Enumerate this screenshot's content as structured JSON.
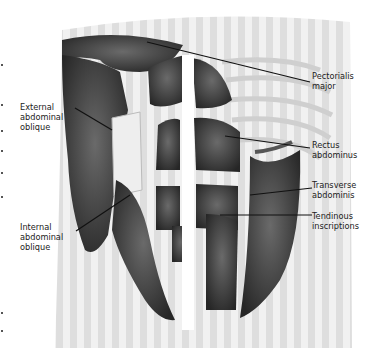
{
  "figure": {
    "colors": {
      "background": "#ffffff",
      "torso_stripes_light": "#eeeeee",
      "torso_stripes_dark": "#d9d9d9",
      "muscle_dark": "#2e2e2e",
      "muscle_mid": "#5a5a5a",
      "rib": "#e4e4e4",
      "leader_line": "#111111",
      "label_text": "#222222"
    }
  },
  "labels": {
    "pectoralis_major": [
      "Pectorialis",
      "major"
    ],
    "external_oblique": [
      "External",
      "abdominal",
      "oblique"
    ],
    "rectus": [
      "Rectus",
      "abdominus"
    ],
    "transverse": [
      "Transverse",
      "abdominis"
    ],
    "internal_oblique": [
      "Internal",
      "abdominal",
      "oblique"
    ],
    "tendinous": [
      "Tendinous",
      "inscriptions"
    ]
  }
}
